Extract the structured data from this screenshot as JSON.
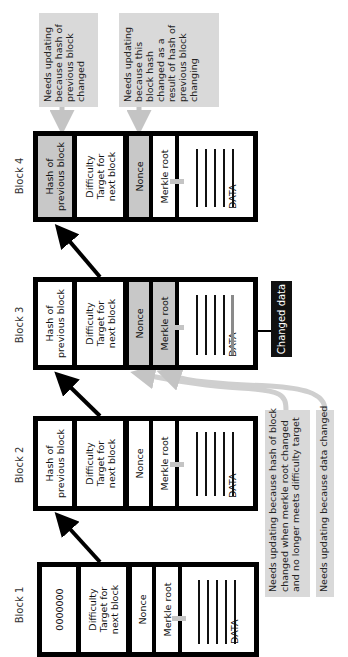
{
  "diagram": {
    "blocks": [
      {
        "label": "Block 1",
        "hash": "0000000",
        "difficulty_title": "Difficulty",
        "difficulty_sub": "Target for next block",
        "nonce": "Nonce",
        "merkle": "Merkle root",
        "data": "DATA",
        "highlighted": []
      },
      {
        "label": "Block 2",
        "hash": "Hash of previous block",
        "difficulty_title": "Difficulty",
        "difficulty_sub": "Target for next block",
        "nonce": "Nonce",
        "merkle": "Merkle root",
        "data": "DATA",
        "highlighted": []
      },
      {
        "label": "Block 3",
        "hash": "Hash of previous block",
        "difficulty_title": "Difficulty",
        "difficulty_sub": "Target for next block",
        "nonce": "Nonce",
        "merkle": "Merkle root",
        "data": "DATA",
        "highlighted": [
          "nonce",
          "merkle",
          "data_line_5"
        ]
      },
      {
        "label": "Block 4",
        "hash": "Hash of previous block",
        "difficulty_title": "Difficulty",
        "difficulty_sub": "Target for next block",
        "nonce": "Nonce",
        "merkle": "Merkle root",
        "data": "DATA",
        "highlighted": [
          "hash",
          "nonce"
        ]
      }
    ],
    "callouts": {
      "block4_hash": "Needs updating because hash of previous block changed",
      "block4_nonce": "Needs updating because this block hash changed as a result of hash of previous block changing",
      "block3_nonce": "Needs updating because hash of block changed when merkle root changed and no longer meets difficulty target",
      "block3_merkle": "Needs updating because data changed",
      "changed_data": "Changed data"
    },
    "callout_lines": {
      "block4_hash": [
        "Needs updating",
        "because hash of",
        "previous block",
        "changed"
      ],
      "block4_nonce": [
        "Needs updating",
        "because this",
        "block hash",
        "changed as a",
        "result of hash of",
        "previous block",
        "changing"
      ],
      "block3_nonce": [
        "Needs updating because hash of block",
        "changed when merkle root changed",
        "and no longer meets difficulty target"
      ],
      "block3_merkle": [
        "Needs updating because data changed"
      ]
    },
    "colors": {
      "border": "#000000",
      "highlight": "#c8c8c8",
      "callout_bg": "#d9d9d9",
      "gray_arrow": "#c4c4c4",
      "changed_label_bg": "#111111"
    }
  }
}
